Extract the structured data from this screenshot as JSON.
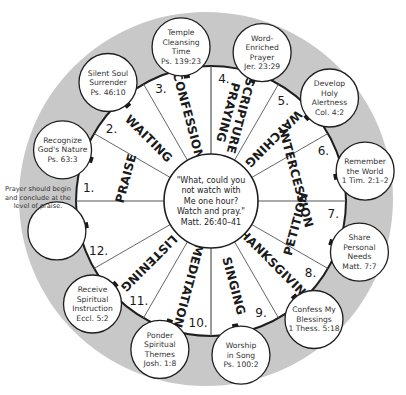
{
  "colors": {
    "ring": "#c8c8c8",
    "wheel": "#ffffff",
    "stroke": "#1e1e1e",
    "spoke": "#555555",
    "text": "#1a1a1a"
  },
  "center": {
    "lines": [
      "\"What, could you",
      "not watch with",
      "Me one hour?",
      "Watch and pray.\"",
      "Matt. 26:40–41"
    ]
  },
  "note": {
    "lines": [
      "Prayer should begin",
      "and conclude at the",
      "level of praise."
    ]
  },
  "segments": [
    {
      "number": "1.",
      "label": "PRAISE",
      "bubble": [
        "Recognize",
        "God's Nature",
        "Ps. 63:3"
      ]
    },
    {
      "number": "2.",
      "label": "WAITING",
      "bubble": [
        "Silent Soul",
        "Surrender",
        "Ps. 46:10"
      ]
    },
    {
      "number": "3.",
      "label": "CONFESSION",
      "bubble": [
        "Temple",
        "Cleansing",
        "Time",
        "Ps. 139:23"
      ]
    },
    {
      "number": "4.",
      "label": "SCRIPTURE PRAYING",
      "label_lines": [
        "SCRIPTURE",
        "PRAYING"
      ],
      "bubble": [
        "Word-",
        "Enriched",
        "Prayer",
        "Jer. 23:29"
      ]
    },
    {
      "number": "5.",
      "label": "WATCHING",
      "bubble": [
        "Develop",
        "Holy",
        "Alertness",
        "Col. 4:2"
      ]
    },
    {
      "number": "6.",
      "label": "INTERCESSION",
      "bubble": [
        "Remember",
        "the World",
        "1 Tim. 2:1–2"
      ]
    },
    {
      "number": "7.",
      "label": "PETITION",
      "bubble": [
        "Share",
        "Personal",
        "Needs",
        "Matt. 7:7"
      ]
    },
    {
      "number": "8.",
      "label": "THANKSGIVING",
      "bubble": [
        "Confess My",
        "Blessings",
        "1 Thess. 5:18"
      ]
    },
    {
      "number": "9.",
      "label": "SINGING",
      "bubble": [
        "Worship",
        "in Song",
        "Ps. 100:2"
      ]
    },
    {
      "number": "10.",
      "label": "MEDITATION",
      "bubble": [
        "Ponder",
        "Spiritual",
        "Themes",
        "Josh. 1:8"
      ]
    },
    {
      "number": "11.",
      "label": "LISTENING",
      "bubble": [
        "Receive",
        "Spiritual",
        "Instruction",
        "Eccl. 5:2"
      ]
    },
    {
      "number": "12.",
      "label": "",
      "bubble": []
    }
  ]
}
